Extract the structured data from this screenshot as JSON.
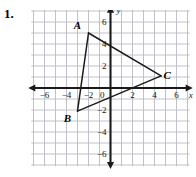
{
  "exercise": {
    "number": "1."
  },
  "figure": {
    "type": "coordinate-plane-triangle",
    "axis_labels": {
      "x_var": "x",
      "y_var": "y"
    },
    "x_ticks": [
      {
        "value": -6,
        "label": "−6"
      },
      {
        "value": -4,
        "label": "−4"
      },
      {
        "value": -2,
        "label": "−2"
      },
      {
        "value": 0,
        "label": "0"
      },
      {
        "value": 2,
        "label": "2"
      },
      {
        "value": 4,
        "label": "4"
      },
      {
        "value": 6,
        "label": "6"
      }
    ],
    "y_ticks": [
      {
        "value": 6,
        "label": "6"
      },
      {
        "value": 4,
        "label": "4"
      },
      {
        "value": 2,
        "label": "2"
      },
      {
        "value": -2,
        "label": "−2"
      },
      {
        "value": -4,
        "label": "−4"
      },
      {
        "value": -6,
        "label": "−6"
      }
    ],
    "grid": {
      "x_min": -7.2,
      "x_max": 7.2,
      "y_min": -7.1,
      "y_max": 7.2,
      "step": 1,
      "visible": true,
      "color": "#b9b9c4"
    },
    "axes": {
      "color": "#1a1a1a",
      "arrows": [
        "left",
        "right",
        "up",
        "down"
      ]
    },
    "vertices": [
      {
        "name": "A",
        "x": -2.0,
        "y": 5.0,
        "label": "A",
        "label_dx": -11,
        "label_dy": -4
      },
      {
        "name": "B",
        "x": -3.0,
        "y": -2.1,
        "label": "B",
        "label_dx": -10,
        "label_dy": 11
      },
      {
        "name": "C",
        "x": 4.6,
        "y": 1.1,
        "label": "C",
        "label_dx": 6,
        "label_dy": 3
      }
    ],
    "edges": [
      {
        "from": "A",
        "to": "B"
      },
      {
        "from": "B",
        "to": "C"
      },
      {
        "from": "C",
        "to": "A"
      }
    ],
    "stroke_color": "#1a1a1a"
  }
}
